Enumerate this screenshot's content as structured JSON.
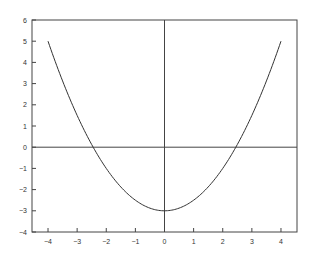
{
  "chart_data": {
    "type": "line",
    "title": "",
    "xlabel": "",
    "ylabel": "",
    "xlim": [
      -4.55,
      4.55
    ],
    "ylim": [
      -4,
      6
    ],
    "grid": false,
    "legend": null,
    "x_ticks": [
      -4,
      -3,
      -2,
      -1,
      0,
      1,
      2,
      3,
      4
    ],
    "y_ticks": [
      -4,
      -3,
      -2,
      -1,
      0,
      1,
      2,
      3,
      4,
      5,
      6
    ],
    "reference_lines": [
      {
        "orientation": "horizontal",
        "value": 0
      },
      {
        "orientation": "vertical",
        "value": 0
      }
    ],
    "series": [
      {
        "name": "y = 0.5x^2 - 3",
        "x": [
          -4,
          -3.5,
          -3,
          -2.5,
          -2,
          -1.5,
          -1,
          -0.5,
          0,
          0.5,
          1,
          1.5,
          2,
          2.5,
          3,
          3.5,
          4
        ],
        "y": [
          5,
          3.125,
          1.5,
          0.125,
          -1,
          -1.875,
          -2.5,
          -2.875,
          -3,
          -2.875,
          -2.5,
          -1.875,
          -1,
          0.125,
          1.5,
          3.125,
          5
        ]
      }
    ]
  },
  "colors": {
    "line": "#333333",
    "frame": "#444444",
    "background": "#ffffff"
  }
}
